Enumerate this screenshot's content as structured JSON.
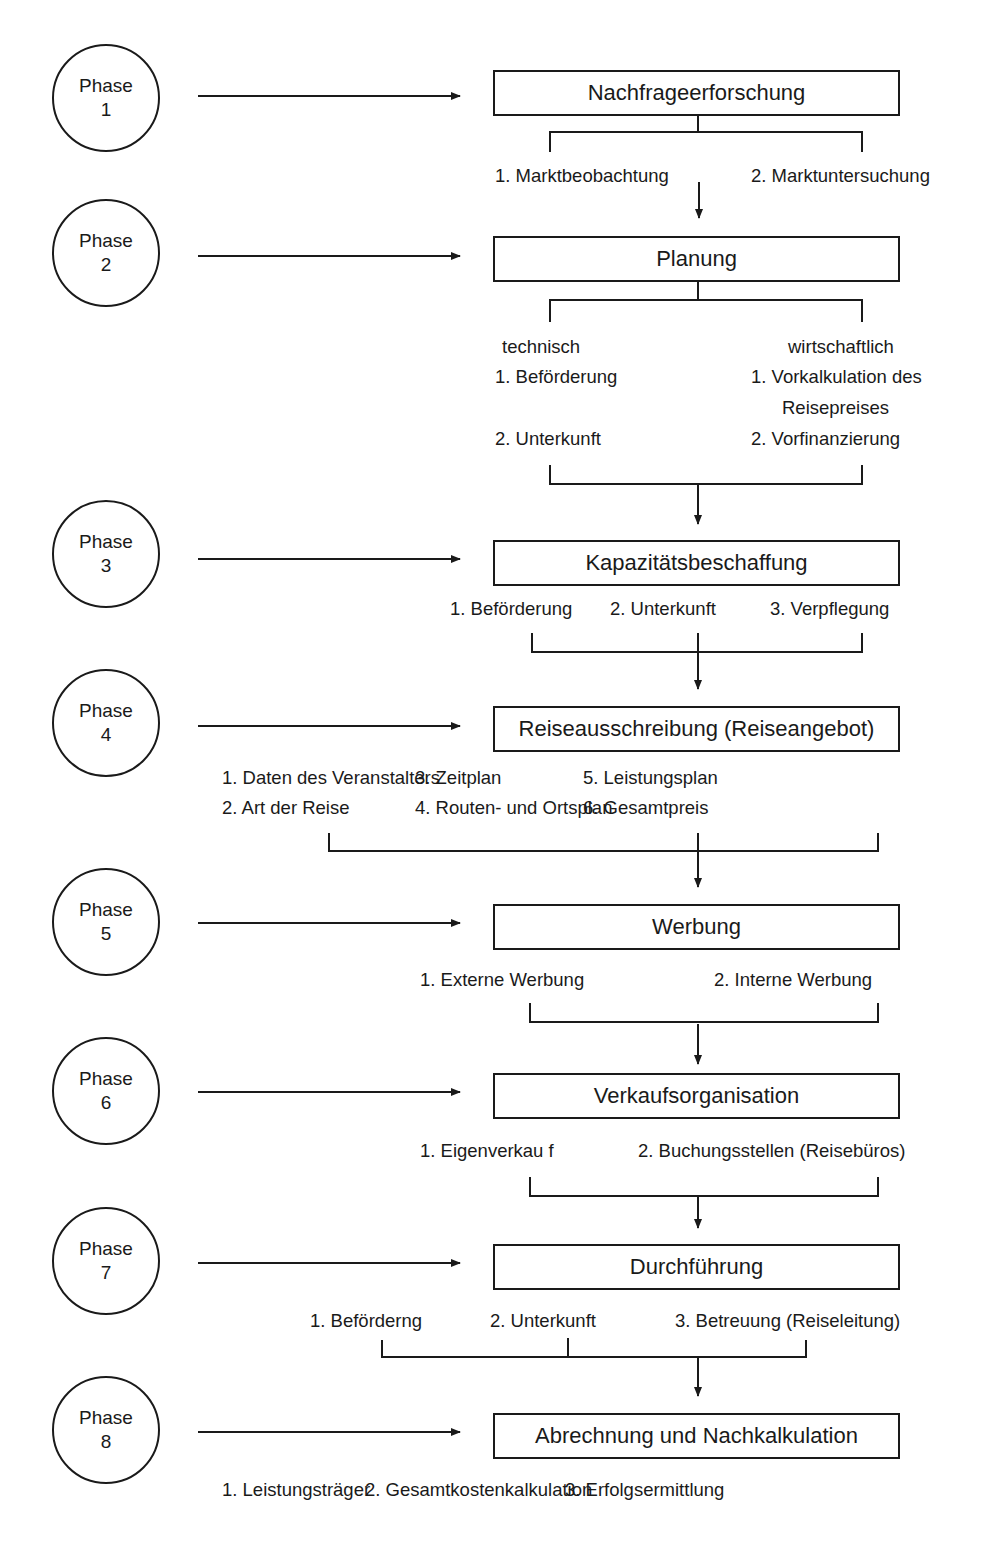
{
  "phases": [
    {
      "word": "Phase",
      "number": "1",
      "title": "Nachfrageerforschung",
      "items": [
        "1. Marktbeobachtung",
        "2. Marktuntersuchung"
      ]
    },
    {
      "word": "Phase",
      "number": "2",
      "title": "Planung",
      "groups": [
        {
          "heading": "technisch",
          "items": [
            "1. Beförderung",
            "2. Unterkunft"
          ]
        },
        {
          "heading": "wirtschaftlich",
          "items": [
            "1. Vorkalkulation des",
            "Reisepreises",
            "2. Vorfinanzierung"
          ]
        }
      ]
    },
    {
      "word": "Phase",
      "number": "3",
      "title": "Kapazitätsbeschaffung",
      "items": [
        "1. Beförderung",
        "2. Unterkunft",
        "3. Verpflegung"
      ]
    },
    {
      "word": "Phase",
      "number": "4",
      "title": "Reiseausschreibung (Reiseangebot)",
      "items": [
        "1. Daten des Veranstalters",
        "2. Art der Reise",
        "3. Zeitplan",
        "4. Routen- und Ortsplan",
        "5. Leistungsplan",
        "6. Gesamtpreis"
      ]
    },
    {
      "word": "Phase",
      "number": "5",
      "title": "Werbung",
      "items": [
        "1. Externe Werbung",
        "2. Interne Werbung"
      ]
    },
    {
      "word": "Phase",
      "number": "6",
      "title": "Verkaufsorganisation",
      "items": [
        "1. Eigenverkau f",
        "2. Buchungsstellen (Reisebüros)"
      ]
    },
    {
      "word": "Phase",
      "number": "7",
      "title": "Durchführung",
      "items": [
        "1. Beförderng",
        "2. Unterkunft",
        "3. Betreuung (Reiseleitung)"
      ]
    },
    {
      "word": "Phase",
      "number": "8",
      "title": "Abrechnung und Nachkalkulation",
      "items": [
        "1. Leistungsträger",
        "2. Gesamtkostenkalkulation",
        "3. Erfolgsermittlung"
      ]
    }
  ],
  "colors": {
    "line": "#1a1a1a",
    "background": "#ffffff"
  }
}
